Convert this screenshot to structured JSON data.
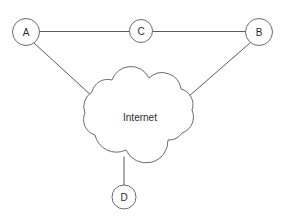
{
  "diagram": {
    "type": "network-topology",
    "title": "",
    "background_color": "#ffffff",
    "line_color": "#5a5a5a",
    "node_stroke_color": "#6b6b6b",
    "node_fill_color": "#ffffff",
    "text_color": "#2b2b2b",
    "nodes": [
      {
        "id": "A",
        "label": "A",
        "cx": 26,
        "cy": 32,
        "r": 13.5,
        "shape": "circle"
      },
      {
        "id": "C",
        "label": "C",
        "cx": 141,
        "cy": 31,
        "r": 11.5,
        "shape": "circle"
      },
      {
        "id": "B",
        "label": "B",
        "cx": 259,
        "cy": 32,
        "r": 13.5,
        "shape": "circle"
      },
      {
        "id": "D",
        "label": "D",
        "cx": 124,
        "cy": 197,
        "r": 12,
        "shape": "circle"
      }
    ],
    "cloud": {
      "id": "internet-cloud",
      "label": "Internet",
      "label_x": 140,
      "label_y": 117,
      "bounds": {
        "x": 84,
        "y": 74,
        "width": 112,
        "height": 88
      }
    },
    "links": [
      {
        "from": "A",
        "to": "C",
        "kind": "straight",
        "x1": 39.5,
        "y1": 31.5,
        "x2": 129.5,
        "y2": 31.5
      },
      {
        "from": "C",
        "to": "B",
        "kind": "straight",
        "x1": 152.5,
        "y1": 31.5,
        "x2": 245.5,
        "y2": 31.5
      },
      {
        "from": "A",
        "to": "internet-cloud",
        "kind": "straight",
        "x1": 34,
        "y1": 43,
        "x2": 93,
        "y2": 97
      },
      {
        "from": "B",
        "to": "internet-cloud",
        "kind": "straight",
        "x1": 250,
        "y1": 43,
        "x2": 188,
        "y2": 97
      },
      {
        "from": "internet-cloud",
        "to": "D",
        "kind": "straight",
        "x1": 124,
        "y1": 157,
        "x2": 124,
        "y2": 185
      }
    ]
  }
}
